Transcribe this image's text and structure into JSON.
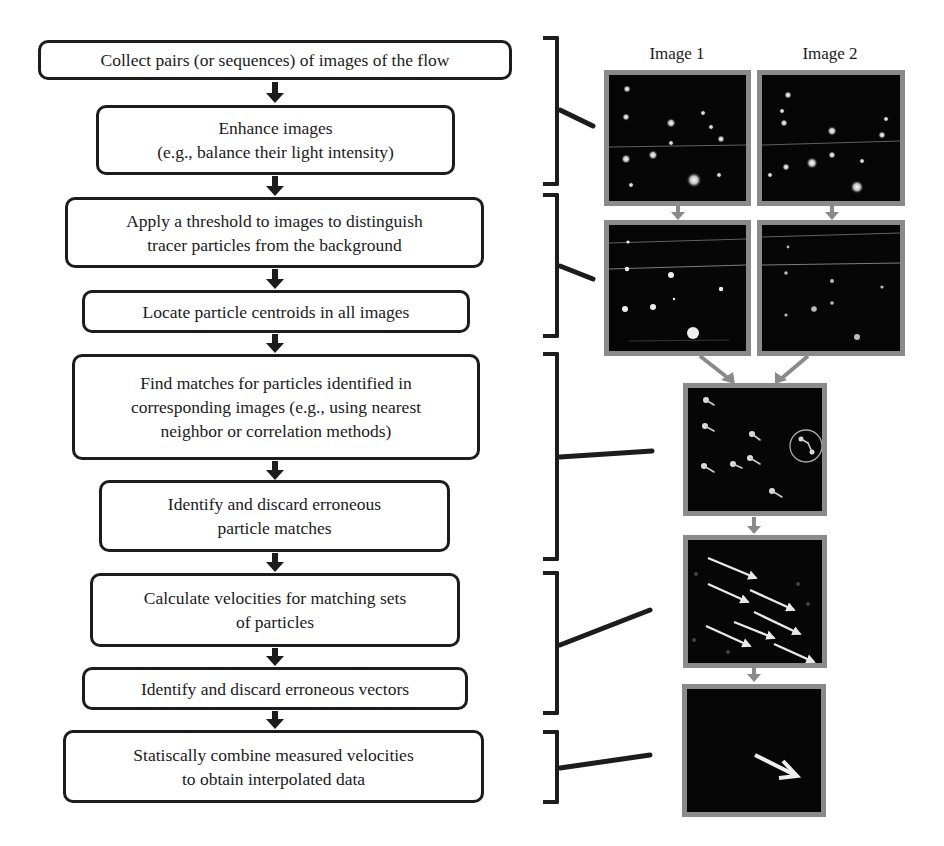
{
  "diagram": {
    "column_labels": [
      "Image 1",
      "Image 2"
    ],
    "steps": [
      {
        "id": "collect",
        "lines": [
          "Collect pairs (or sequences) of images of the flow"
        ]
      },
      {
        "id": "enhance",
        "lines": [
          "Enhance images",
          "(e.g., balance their light intensity)"
        ]
      },
      {
        "id": "threshold",
        "lines": [
          "Apply a threshold to images to distinguish",
          "tracer particles from the background"
        ]
      },
      {
        "id": "locate",
        "lines": [
          "Locate particle centroids in all images"
        ]
      },
      {
        "id": "match",
        "lines": [
          "Find matches for particles identified in",
          "corresponding images (e.g., using nearest",
          "neighbor or correlation methods)"
        ]
      },
      {
        "id": "discard-matches",
        "lines": [
          "Identify and discard erroneous",
          "particle matches"
        ]
      },
      {
        "id": "velocities",
        "lines": [
          "Calculate velocities for matching sets",
          "of particles"
        ]
      },
      {
        "id": "discard-vectors",
        "lines": [
          "Identify and discard erroneous vectors"
        ]
      },
      {
        "id": "combine",
        "lines": [
          "Statiscally combine measured velocities",
          "to obtain interpolated data"
        ]
      }
    ],
    "groups": [
      {
        "steps": [
          "collect",
          "enhance"
        ],
        "panel": "raw-images-pair"
      },
      {
        "steps": [
          "threshold",
          "locate"
        ],
        "panel": "thresholded-images-pair"
      },
      {
        "steps": [
          "match",
          "discard-matches"
        ],
        "panel": "matched-particles-image"
      },
      {
        "steps": [
          "velocities",
          "discard-vectors"
        ],
        "panel": "velocity-vectors-image"
      },
      {
        "steps": [
          "combine"
        ],
        "panel": "interpolated-vector-image"
      }
    ],
    "colors": {
      "box_border": "#1c1c1c",
      "panel_border": "#8a8a8a",
      "panel_bg": "#060606",
      "panel_arrow": "#8a8a8a",
      "particle": "#e8e8e8"
    }
  }
}
